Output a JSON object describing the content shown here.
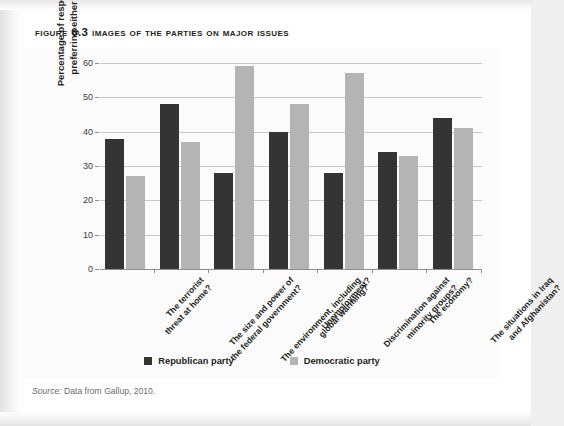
{
  "figure": {
    "title": "Figure 6.3  Images of the Parties on Major Issues",
    "source_label": "Source:",
    "source_text": " Data from Gallup, 2010."
  },
  "legend": {
    "items": [
      {
        "label": "Republican party",
        "color": "#343434",
        "swatch": "republican-swatch"
      },
      {
        "label": "Democratic party",
        "color": "#b4b4b4",
        "swatch": "democratic-swatch"
      }
    ]
  },
  "chart_data": {
    "type": "bar",
    "title": "Images of the Parties on Major Issues",
    "xlabel": "",
    "ylabel": "Percentage of respondents preferring either party",
    "ylim": [
      0,
      60
    ],
    "yticks": [
      0,
      10,
      20,
      30,
      40,
      50,
      60
    ],
    "ytick_labels": [
      "0",
      "10",
      "20",
      "30",
      "40",
      "50",
      "60"
    ],
    "grid": true,
    "legend_position": "bottom",
    "categories": [
      "The terrorist threat at home?",
      "The size and power of the federal government?",
      "The environment, including global warming?",
      "Unemployment?",
      "Discrimination against minority groups?",
      "The economy?",
      "The situations in Iraq and Afghanistan?"
    ],
    "category_lines": [
      [
        "The terrorist",
        "threat at home?"
      ],
      [
        "The size and power of",
        "the federal government?"
      ],
      [
        "The environment, including",
        "global warming?"
      ],
      [
        "Unemployment?"
      ],
      [
        "Discrimination against",
        "minority groups?"
      ],
      [
        "The economy?"
      ],
      [
        "The situations in Iraq",
        "and Afghanistan?"
      ]
    ],
    "series": [
      {
        "name": "Republican party",
        "color": "#343434",
        "values": [
          38,
          48,
          28,
          40,
          28,
          34,
          44
        ]
      },
      {
        "name": "Democratic party",
        "color": "#b4b4b4",
        "values": [
          27,
          37,
          59,
          48,
          57,
          33,
          41
        ]
      }
    ]
  }
}
